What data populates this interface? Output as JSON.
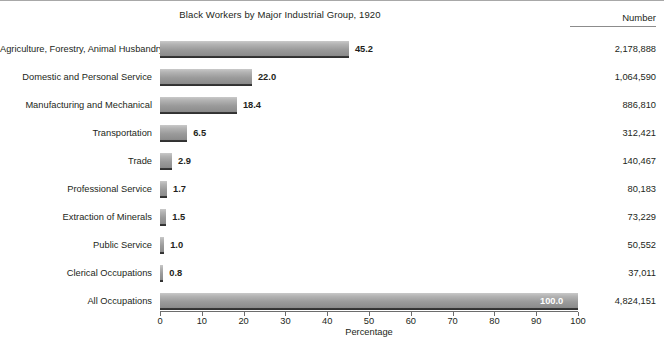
{
  "chart_data": {
    "type": "bar",
    "orientation": "horizontal",
    "title": "Black Workers by Major Industrial Group, 1920",
    "xlabel": "Percentage",
    "ylabel": "",
    "xlim": [
      0,
      100
    ],
    "xticks": [
      0,
      10,
      20,
      30,
      40,
      50,
      60,
      70,
      80,
      90,
      100
    ],
    "xticklabels": [
      "0",
      "10",
      "20",
      "30",
      "40",
      "50",
      "60",
      "70",
      "80",
      "90",
      "100"
    ],
    "grid": false,
    "legend": null,
    "value_column_header": "Number",
    "categories": [
      "Agriculture, Forestry, Animal Husbandry",
      "Domestic and Personal Service",
      "Manufacturing and Mechanical",
      "Transportation",
      "Trade",
      "Professional Service",
      "Extraction of Minerals",
      "Public Service",
      "Clerical Occupations",
      "All Occupations"
    ],
    "values": [
      45.2,
      22.0,
      18.4,
      6.5,
      2.9,
      1.7,
      1.5,
      1.0,
      0.8,
      100.0
    ],
    "value_labels": [
      "45.2",
      "22.0",
      "18.4",
      "6.5",
      "2.9",
      "1.7",
      "1.5",
      "1.0",
      "0.8",
      "100.0"
    ],
    "counts": [
      2178888,
      1064590,
      886810,
      312421,
      140467,
      80183,
      73229,
      50552,
      37011,
      4824151
    ],
    "count_labels": [
      "2,178,888",
      "1,064,590",
      "886,810",
      "312,421",
      "140,467",
      "80,183",
      "73,229",
      "50,552",
      "37,011",
      "4,824,151"
    ],
    "colors": {
      "bar_light": "#c9c9c9",
      "bar_mid": "#9a9a9a",
      "bar_dark": "#2e2e2e",
      "text": "#231f20",
      "axis": "#6d6d6d",
      "background": "#ffffff",
      "inside_label": "#ffffff"
    }
  }
}
